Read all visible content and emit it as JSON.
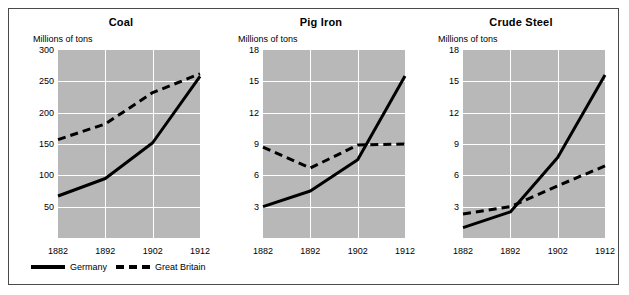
{
  "figure": {
    "unit_label": "Millions of tons",
    "x_categories": [
      1882,
      1892,
      1902,
      1912
    ],
    "xtick_labels": [
      "1882",
      "1892",
      "1902",
      "1912"
    ]
  },
  "legend": {
    "items": [
      {
        "label": "Germany",
        "style": "solid",
        "color": "#000000",
        "icon": "solid-line-icon"
      },
      {
        "label": "Great Britain",
        "style": "dashed",
        "color": "#000000",
        "icon": "dashed-line-icon"
      }
    ]
  },
  "colors": {
    "plot_background": "#b8b8b8",
    "gridline": "#ffffff",
    "line": "#000000",
    "frame_border": "#4a4a4a",
    "page_background": "#ffffff"
  },
  "chart_data": [
    {
      "type": "line",
      "title": "Coal",
      "xlabel": "",
      "ylabel": "Millions of tons",
      "x": [
        1882,
        1892,
        1902,
        1912
      ],
      "xtick_labels": [
        "1882",
        "1892",
        "1902",
        "1912"
      ],
      "ylim": [
        0,
        300
      ],
      "yticks": [
        50,
        100,
        150,
        200,
        250,
        300
      ],
      "ytick_labels": [
        "50",
        "100",
        "150",
        "200",
        "250",
        "300"
      ],
      "grid": true,
      "legend_position": "below-figure",
      "series": [
        {
          "name": "Germany",
          "style": "solid",
          "values": [
            67,
            95,
            152,
            258
          ]
        },
        {
          "name": "Great Britain",
          "style": "dashed",
          "values": [
            157,
            182,
            232,
            262
          ]
        }
      ]
    },
    {
      "type": "line",
      "title": "Pig Iron",
      "xlabel": "",
      "ylabel": "Millions of tons",
      "x": [
        1882,
        1892,
        1902,
        1912
      ],
      "xtick_labels": [
        "1882",
        "1892",
        "1902",
        "1912"
      ],
      "ylim": [
        0,
        18
      ],
      "yticks": [
        3,
        6,
        9,
        12,
        15,
        18
      ],
      "ytick_labels": [
        "3",
        "6",
        "9",
        "12",
        "15",
        "18"
      ],
      "grid": true,
      "legend_position": "below-figure",
      "series": [
        {
          "name": "Germany",
          "style": "solid",
          "values": [
            3.0,
            4.5,
            7.5,
            15.5
          ]
        },
        {
          "name": "Great Britain",
          "style": "dashed",
          "values": [
            8.7,
            6.7,
            8.9,
            9.0
          ]
        }
      ]
    },
    {
      "type": "line",
      "title": "Crude Steel",
      "xlabel": "",
      "ylabel": "Millions of tons",
      "x": [
        1882,
        1892,
        1902,
        1912
      ],
      "xtick_labels": [
        "1882",
        "1892",
        "1902",
        "1912"
      ],
      "ylim": [
        0,
        18
      ],
      "yticks": [
        3,
        6,
        9,
        12,
        15,
        18
      ],
      "ytick_labels": [
        "3",
        "6",
        "9",
        "12",
        "15",
        "18"
      ],
      "grid": true,
      "legend_position": "below-figure",
      "series": [
        {
          "name": "Germany",
          "style": "solid",
          "values": [
            1.0,
            2.5,
            7.7,
            15.6
          ]
        },
        {
          "name": "Great Britain",
          "style": "dashed",
          "values": [
            2.3,
            3.0,
            5.0,
            6.9
          ]
        }
      ]
    }
  ],
  "panels_layout": [
    {
      "left": 14,
      "width": 196,
      "plot_left": 35,
      "plot_top": 41,
      "plot_width": 142,
      "plot_height": 188,
      "unit_left": 10
    },
    {
      "left": 214,
      "width": 196,
      "plot_left": 40,
      "plot_top": 41,
      "plot_width": 142,
      "plot_height": 188,
      "unit_left": 15
    },
    {
      "left": 414,
      "width": 196,
      "plot_left": 40,
      "plot_top": 41,
      "plot_width": 142,
      "plot_height": 188,
      "unit_left": 15
    }
  ]
}
